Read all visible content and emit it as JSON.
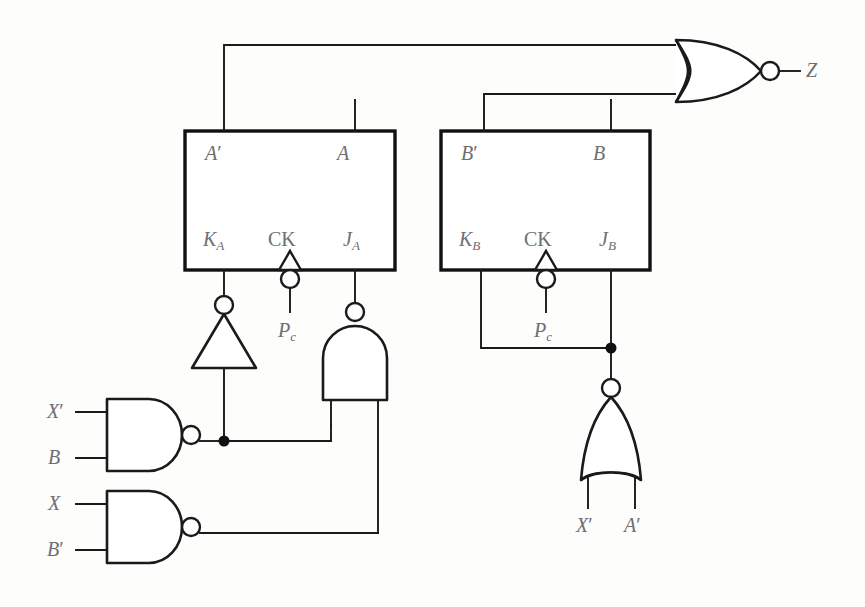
{
  "diagram": {
    "stroke_color": "#1a1a1a",
    "label_color": "#6e6e72",
    "background": "#fdfdfc"
  },
  "flipflops": [
    {
      "id": "ff-a",
      "outputs": {
        "qbar": "A′",
        "q": "A"
      },
      "inputs": {
        "k": "K",
        "k_sub": "A",
        "clock": "CK",
        "j": "J",
        "j_sub": "A"
      },
      "clock_source": "P",
      "clock_source_sub": "c"
    },
    {
      "id": "ff-b",
      "outputs": {
        "qbar": "B′",
        "q": "B"
      },
      "inputs": {
        "k": "K",
        "k_sub": "B",
        "clock": "CK",
        "j": "J",
        "j_sub": "B"
      },
      "clock_source": "P",
      "clock_source_sub": "c"
    }
  ],
  "gates": [
    {
      "id": "nor-output",
      "type": "nor",
      "output_label": "Z",
      "input_count": 2
    },
    {
      "id": "inverter-ka",
      "type": "inverter",
      "input_count": 1
    },
    {
      "id": "nand-ja",
      "type": "nand",
      "input_count": 2
    },
    {
      "id": "nand-xprime-b",
      "type": "nand",
      "input_count": 2,
      "inputs": [
        "X′",
        "B"
      ]
    },
    {
      "id": "nand-x-bprime",
      "type": "nand",
      "input_count": 2,
      "inputs": [
        "X",
        "B′"
      ]
    },
    {
      "id": "nor-jb-kb",
      "type": "nor",
      "input_count": 2,
      "inputs": [
        "X′",
        "A′"
      ]
    }
  ],
  "labels": {
    "a_prime": "A",
    "a_prime_mark": "′",
    "a": "A",
    "b_prime": "B",
    "b_prime_mark": "′",
    "b": "B",
    "k_a": "K",
    "k_a_sub": "A",
    "ck_a": "CK",
    "j_a": "J",
    "j_a_sub": "A",
    "pc_a": "P",
    "pc_a_sub": "c",
    "k_b": "K",
    "k_b_sub": "B",
    "ck_b": "CK",
    "j_b": "J",
    "j_b_sub": "B",
    "pc_b": "P",
    "pc_b_sub": "c",
    "z": "Z",
    "in_xprime_1": "X",
    "in_xprime_1_mark": "′",
    "in_b_1": "B",
    "in_x_2": "X",
    "in_bprime_2": "B",
    "in_bprime_2_mark": "′",
    "nor_in_xprime": "X",
    "nor_in_xprime_mark": "′",
    "nor_in_aprime": "A",
    "nor_in_aprime_mark": "′"
  }
}
